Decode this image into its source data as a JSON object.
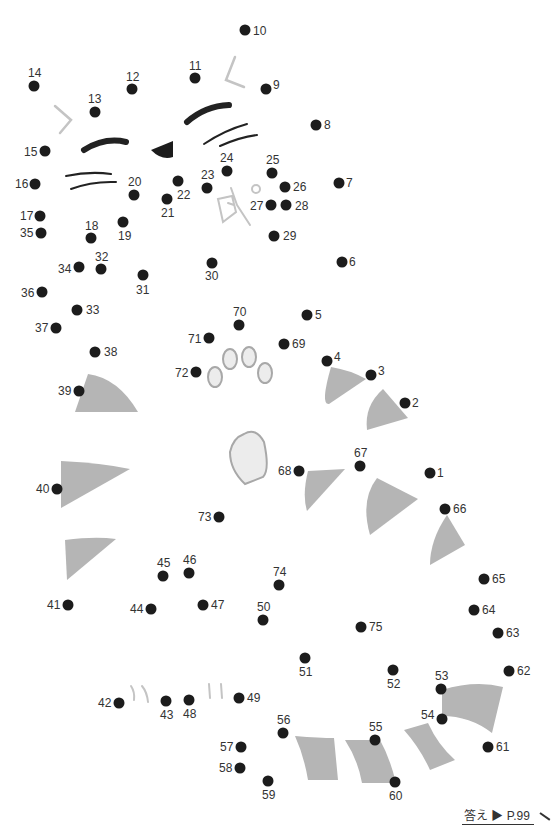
{
  "puzzle": {
    "type": "connect-the-dots",
    "dot_color": "#1c1c1c",
    "shape_fill": "#b5b5b5",
    "line_gray": "#c4c4c4",
    "ink": "#222222",
    "dots": [
      {
        "n": 1,
        "x": 430,
        "y": 473,
        "lx": 437,
        "ly": 467
      },
      {
        "n": 2,
        "x": 405,
        "y": 403,
        "lx": 412,
        "ly": 397
      },
      {
        "n": 3,
        "x": 371,
        "y": 375,
        "lx": 378,
        "ly": 365
      },
      {
        "n": 4,
        "x": 327,
        "y": 361,
        "lx": 334,
        "ly": 351
      },
      {
        "n": 5,
        "x": 307,
        "y": 315,
        "lx": 315,
        "ly": 309
      },
      {
        "n": 6,
        "x": 342,
        "y": 262,
        "lx": 349,
        "ly": 256
      },
      {
        "n": 7,
        "x": 339,
        "y": 183,
        "lx": 346,
        "ly": 177
      },
      {
        "n": 8,
        "x": 316,
        "y": 125,
        "lx": 324,
        "ly": 119
      },
      {
        "n": 9,
        "x": 266,
        "y": 89,
        "lx": 273,
        "ly": 79
      },
      {
        "n": 10,
        "x": 245,
        "y": 30,
        "lx": 253,
        "ly": 25
      },
      {
        "n": 11,
        "x": 195,
        "y": 78,
        "lx": 189,
        "ly": 60
      },
      {
        "n": 12,
        "x": 132,
        "y": 89,
        "lx": 126,
        "ly": 71
      },
      {
        "n": 13,
        "x": 95,
        "y": 112,
        "lx": 88,
        "ly": 93
      },
      {
        "n": 14,
        "x": 34,
        "y": 86,
        "lx": 28,
        "ly": 67
      },
      {
        "n": 15,
        "x": 45,
        "y": 151,
        "lx": 24,
        "ly": 146
      },
      {
        "n": 16,
        "x": 35,
        "y": 184,
        "lx": 15,
        "ly": 178
      },
      {
        "n": 17,
        "x": 40,
        "y": 216,
        "lx": 20,
        "ly": 210
      },
      {
        "n": 18,
        "x": 91,
        "y": 238,
        "lx": 85,
        "ly": 220
      },
      {
        "n": 19,
        "x": 123,
        "y": 222,
        "lx": 118,
        "ly": 230
      },
      {
        "n": 20,
        "x": 134,
        "y": 195,
        "lx": 128,
        "ly": 176
      },
      {
        "n": 21,
        "x": 167,
        "y": 199,
        "lx": 161,
        "ly": 207
      },
      {
        "n": 22,
        "x": 178,
        "y": 181,
        "lx": 177,
        "ly": 189
      },
      {
        "n": 23,
        "x": 207,
        "y": 188,
        "lx": 201,
        "ly": 169
      },
      {
        "n": 24,
        "x": 227,
        "y": 171,
        "lx": 220,
        "ly": 152
      },
      {
        "n": 25,
        "x": 272,
        "y": 173,
        "lx": 266,
        "ly": 154
      },
      {
        "n": 26,
        "x": 285,
        "y": 187,
        "lx": 293,
        "ly": 181
      },
      {
        "n": 27,
        "x": 271,
        "y": 205,
        "lx": 250,
        "ly": 200
      },
      {
        "n": 28,
        "x": 286,
        "y": 205,
        "lx": 295,
        "ly": 200
      },
      {
        "n": 29,
        "x": 274,
        "y": 236,
        "lx": 283,
        "ly": 230
      },
      {
        "n": 30,
        "x": 212,
        "y": 263,
        "lx": 205,
        "ly": 270
      },
      {
        "n": 31,
        "x": 143,
        "y": 275,
        "lx": 136,
        "ly": 284
      },
      {
        "n": 32,
        "x": 101,
        "y": 269,
        "lx": 95,
        "ly": 251
      },
      {
        "n": 33,
        "x": 77,
        "y": 310,
        "lx": 86,
        "ly": 304
      },
      {
        "n": 34,
        "x": 79,
        "y": 267,
        "lx": 58,
        "ly": 263
      },
      {
        "n": 35,
        "x": 41,
        "y": 233,
        "lx": 20,
        "ly": 227
      },
      {
        "n": 36,
        "x": 42,
        "y": 292,
        "lx": 21,
        "ly": 287
      },
      {
        "n": 37,
        "x": 56,
        "y": 328,
        "lx": 35,
        "ly": 322
      },
      {
        "n": 38,
        "x": 95,
        "y": 352,
        "lx": 104,
        "ly": 346
      },
      {
        "n": 39,
        "x": 79,
        "y": 391,
        "lx": 58,
        "ly": 385
      },
      {
        "n": 40,
        "x": 57,
        "y": 489,
        "lx": 36,
        "ly": 483
      },
      {
        "n": 41,
        "x": 68,
        "y": 605,
        "lx": 47,
        "ly": 599
      },
      {
        "n": 42,
        "x": 119,
        "y": 703,
        "lx": 98,
        "ly": 697
      },
      {
        "n": 43,
        "x": 166,
        "y": 701,
        "lx": 160,
        "ly": 709
      },
      {
        "n": 44,
        "x": 151,
        "y": 609,
        "lx": 130,
        "ly": 603
      },
      {
        "n": 45,
        "x": 163,
        "y": 576,
        "lx": 157,
        "ly": 557
      },
      {
        "n": 46,
        "x": 189,
        "y": 573,
        "lx": 183,
        "ly": 554
      },
      {
        "n": 47,
        "x": 203,
        "y": 605,
        "lx": 211,
        "ly": 599
      },
      {
        "n": 48,
        "x": 189,
        "y": 700,
        "lx": 183,
        "ly": 708
      },
      {
        "n": 49,
        "x": 239,
        "y": 698,
        "lx": 247,
        "ly": 692
      },
      {
        "n": 50,
        "x": 263,
        "y": 620,
        "lx": 257,
        "ly": 601
      },
      {
        "n": 51,
        "x": 305,
        "y": 658,
        "lx": 299,
        "ly": 666
      },
      {
        "n": 52,
        "x": 393,
        "y": 670,
        "lx": 387,
        "ly": 678
      },
      {
        "n": 53,
        "x": 441,
        "y": 689,
        "lx": 435,
        "ly": 670
      },
      {
        "n": 54,
        "x": 442,
        "y": 719,
        "lx": 421,
        "ly": 709
      },
      {
        "n": 55,
        "x": 375,
        "y": 740,
        "lx": 369,
        "ly": 721
      },
      {
        "n": 56,
        "x": 283,
        "y": 733,
        "lx": 277,
        "ly": 714
      },
      {
        "n": 57,
        "x": 241,
        "y": 747,
        "lx": 220,
        "ly": 741
      },
      {
        "n": 58,
        "x": 240,
        "y": 768,
        "lx": 219,
        "ly": 762
      },
      {
        "n": 59,
        "x": 268,
        "y": 781,
        "lx": 262,
        "ly": 789
      },
      {
        "n": 60,
        "x": 395,
        "y": 782,
        "lx": 389,
        "ly": 790
      },
      {
        "n": 61,
        "x": 488,
        "y": 747,
        "lx": 496,
        "ly": 741
      },
      {
        "n": 62,
        "x": 509,
        "y": 671,
        "lx": 517,
        "ly": 665
      },
      {
        "n": 63,
        "x": 498,
        "y": 633,
        "lx": 506,
        "ly": 627
      },
      {
        "n": 64,
        "x": 474,
        "y": 610,
        "lx": 482,
        "ly": 604
      },
      {
        "n": 65,
        "x": 484,
        "y": 579,
        "lx": 492,
        "ly": 573
      },
      {
        "n": 66,
        "x": 445,
        "y": 509,
        "lx": 453,
        "ly": 503
      },
      {
        "n": 67,
        "x": 360,
        "y": 466,
        "lx": 354,
        "ly": 447
      },
      {
        "n": 68,
        "x": 299,
        "y": 471,
        "lx": 278,
        "ly": 465
      },
      {
        "n": 69,
        "x": 284,
        "y": 344,
        "lx": 292,
        "ly": 338
      },
      {
        "n": 70,
        "x": 239,
        "y": 325,
        "lx": 233,
        "ly": 306
      },
      {
        "n": 71,
        "x": 209,
        "y": 338,
        "lx": 188,
        "ly": 333
      },
      {
        "n": 72,
        "x": 196,
        "y": 372,
        "lx": 175,
        "ly": 367
      },
      {
        "n": 73,
        "x": 219,
        "y": 517,
        "lx": 198,
        "ly": 511
      },
      {
        "n": 74,
        "x": 279,
        "y": 585,
        "lx": 273,
        "ly": 566
      },
      {
        "n": 75,
        "x": 361,
        "y": 627,
        "lx": 369,
        "ly": 621
      }
    ]
  },
  "footer": {
    "answer_label": "答え ▶ P.99"
  }
}
